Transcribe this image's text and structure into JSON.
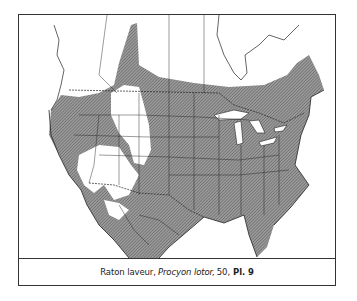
{
  "figure": {
    "type": "range-map",
    "region": "North America",
    "legend_fill": "hatched = range of species",
    "colors": {
      "range_fill": "#8a8a8a",
      "hatch_line": "#555555",
      "land_outline": "#222222",
      "background": "#ffffff",
      "frame": "#333333"
    }
  },
  "caption": {
    "common_name": "Raton laveur,",
    "scientific_name": "Procyon lotor,",
    "page": "50,",
    "plate": "Pl. 9"
  }
}
